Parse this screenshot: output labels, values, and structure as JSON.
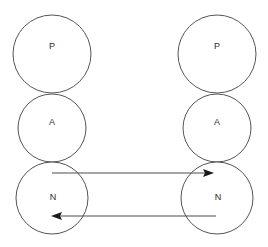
{
  "diagram": {
    "background_color": "#ffffff",
    "stroke_color": "#555555",
    "label_color": "#2b2b2b",
    "arrow_color": "#4d4d4d",
    "arrowhead_color": "#1a1a1a",
    "stacks": [
      {
        "id": "left-stack",
        "name": "left-protocol-stack",
        "center_x": 52,
        "nodes": [
          {
            "id": "left-p",
            "label": "P",
            "layer": "presentation",
            "cx": 52,
            "cy": 54,
            "r": 39
          },
          {
            "id": "left-a",
            "label": "A",
            "layer": "application",
            "cx": 52,
            "cy": 128,
            "r": 34
          },
          {
            "id": "left-n",
            "label": "N",
            "layer": "network",
            "cx": 52,
            "cy": 198,
            "r": 36
          }
        ]
      },
      {
        "id": "right-stack",
        "name": "right-protocol-stack",
        "center_x": 217,
        "nodes": [
          {
            "id": "right-p",
            "label": "P",
            "layer": "presentation",
            "cx": 217,
            "cy": 54,
            "r": 39
          },
          {
            "id": "right-a",
            "label": "A",
            "layer": "application",
            "cx": 217,
            "cy": 128,
            "r": 34
          },
          {
            "id": "right-n",
            "label": "N",
            "layer": "network",
            "cx": 217,
            "cy": 198,
            "r": 36
          }
        ]
      }
    ],
    "arrows": [
      {
        "id": "arrow-left-to-right",
        "name": "arrow-forward",
        "direction": "right",
        "from_node": "left-n",
        "to_node": "right-n",
        "x1": 52,
        "x2": 214,
        "y": 173
      },
      {
        "id": "arrow-right-to-left",
        "name": "arrow-reverse",
        "direction": "left",
        "from_node": "right-n",
        "to_node": "left-n",
        "x1": 216,
        "x2": 51,
        "y": 216
      }
    ]
  }
}
